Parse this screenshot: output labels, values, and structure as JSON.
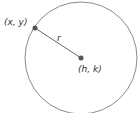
{
  "diagram": {
    "circle": {
      "cx": 81,
      "cy": 58,
      "r": 56,
      "stroke": "#8a8a8a"
    },
    "point_on_circle": {
      "label": "(x, y)",
      "x": 35,
      "y": 28
    },
    "center": {
      "label": "(h, k)",
      "x": 81,
      "y": 58
    },
    "radius": {
      "label": "r"
    },
    "colors": {
      "dot": "#555555",
      "line": "#666666",
      "text": "#333333"
    }
  }
}
